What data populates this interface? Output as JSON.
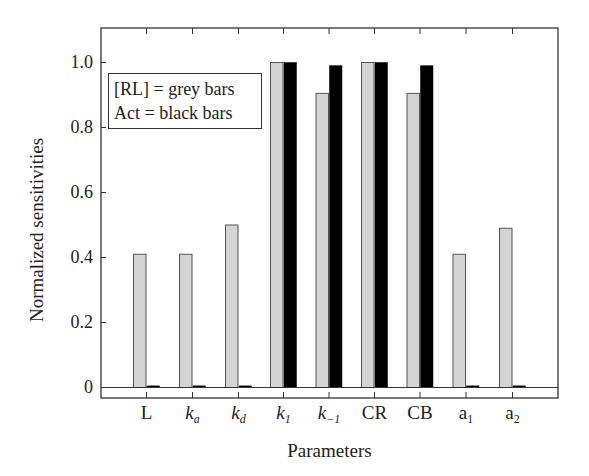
{
  "chart_data": {
    "type": "bar",
    "title": "",
    "xlabel": "Parameters",
    "ylabel": "Normalized sensitivities",
    "ylim": [
      -0.03,
      1.1
    ],
    "yticks": [
      0,
      0.2,
      0.4,
      0.6,
      0.8,
      1.0
    ],
    "ytick_labels": [
      "0",
      "0.2",
      "0.4",
      "0.6",
      "0.8",
      "1.0"
    ],
    "grid": false,
    "legend_position": "upper left",
    "categories": [
      "L",
      "k_a",
      "k_d",
      "k_1",
      "k_-1",
      "CR",
      "CB",
      "a_1",
      "a_2"
    ],
    "series": [
      {
        "name": "[RL]",
        "color": "#d4d4d4",
        "values": [
          0.41,
          0.41,
          0.5,
          1.0,
          0.905,
          1.0,
          0.905,
          0.41,
          0.49
        ]
      },
      {
        "name": "Act",
        "color": "#000000",
        "values": [
          0.005,
          0.005,
          0.005,
          1.0,
          0.99,
          1.0,
          0.99,
          0.005,
          0.005
        ]
      }
    ],
    "legend": [
      "[RL] = grey bars",
      "Act = black bars"
    ]
  },
  "labels": {
    "ylabel": "Normalized sensitivities",
    "xlabel": "Parameters",
    "legend_line1": "[RL] = grey bars",
    "legend_line2": "Act = black bars",
    "yticks": [
      "0",
      "0.2",
      "0.4",
      "0.6",
      "0.8",
      "1.0"
    ],
    "xticks": [
      {
        "main": "L",
        "sub": "",
        "italic": false
      },
      {
        "main": "k",
        "sub": "a",
        "italic": true
      },
      {
        "main": "k",
        "sub": "d",
        "italic": true
      },
      {
        "main": "k",
        "sub": "1",
        "italic": true
      },
      {
        "main": "k",
        "sub": "−1",
        "italic": true
      },
      {
        "main": "CR",
        "sub": "",
        "italic": false
      },
      {
        "main": "CB",
        "sub": "",
        "italic": false
      },
      {
        "main": "a",
        "sub": "1",
        "italic": false
      },
      {
        "main": "a",
        "sub": "2",
        "italic": false
      }
    ]
  }
}
